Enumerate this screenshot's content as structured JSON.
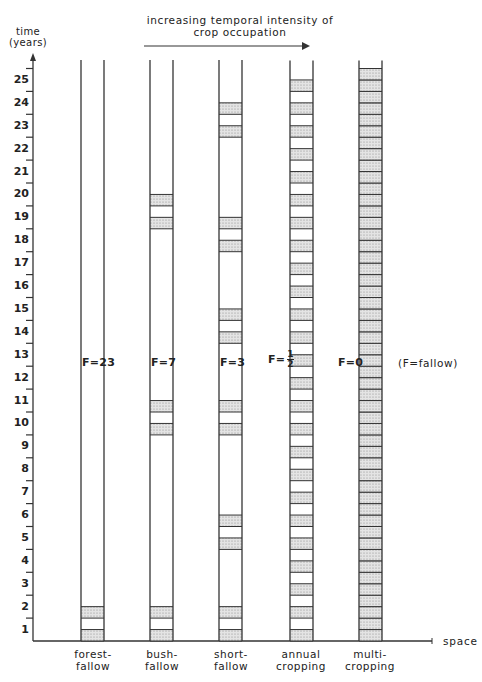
{
  "chart_data": {
    "type": "diagram",
    "title": "increasing temporal intensity of crop occupation",
    "title_lines": [
      "increasing temporal intensity of",
      "crop occupation"
    ],
    "ylabel": "time (years)",
    "ylabel_lines": [
      "time",
      "(years)"
    ],
    "xlabel": "space",
    "yticks": [
      1,
      2,
      3,
      4,
      5,
      6,
      7,
      8,
      9,
      10,
      11,
      12,
      13,
      14,
      15,
      16,
      17,
      18,
      19,
      20,
      21,
      22,
      23,
      24,
      25
    ],
    "ylim": [
      0,
      25
    ],
    "note": "(F = fallow)",
    "cropped_period_unit": "half-year cultivation band",
    "systems": [
      {
        "name": "forest-fallow",
        "label_lines": [
          "forest-",
          "fallow"
        ],
        "fallow_label": "F=23",
        "fallow_years": 23,
        "cultivated_years": [
          1,
          2
        ]
      },
      {
        "name": "bush-fallow",
        "label_lines": [
          "bush-",
          "fallow"
        ],
        "fallow_label": "F=7",
        "fallow_years": 7,
        "cultivated_years": [
          1,
          2,
          10,
          11,
          19,
          20
        ]
      },
      {
        "name": "short-fallow",
        "label_lines": [
          "short-",
          "fallow"
        ],
        "fallow_label": "F=3",
        "fallow_years": 3,
        "cultivated_years": [
          1,
          2,
          5,
          6,
          10,
          11,
          14,
          15,
          18,
          19,
          23,
          24
        ]
      },
      {
        "name": "annual cropping",
        "label_lines": [
          "annual",
          "cropping"
        ],
        "fallow_label": "F=1/2",
        "fallow_years": 0.5,
        "cultivated_years": "every year (one cropped half-year per year)"
      },
      {
        "name": "multi-cropping",
        "label_lines": [
          "multi-",
          "cropping"
        ],
        "fallow_label": "F=0",
        "fallow_years": 0,
        "cultivated_years": "continuous (all years)"
      }
    ]
  },
  "header": {
    "title_line1": "increasing temporal intensity of",
    "title_line2": "crop occupation"
  },
  "axis": {
    "y_label_line1": "time",
    "y_label_line2": "(years)",
    "x_label": "space",
    "ticks": [
      "25",
      "24",
      "23",
      "22",
      "21",
      "20",
      "19",
      "18",
      "17",
      "16",
      "15",
      "14",
      "13",
      "12",
      "11",
      "10",
      "9",
      "8",
      "7",
      "6",
      "5",
      "4",
      "3",
      "2",
      "1"
    ]
  },
  "columns": [
    {
      "label1": "forest-",
      "label2": "fallow",
      "f": "F=23"
    },
    {
      "label1": "bush-",
      "label2": "fallow",
      "f": "F=7"
    },
    {
      "label1": "short-",
      "label2": "fallow",
      "f": "F=3"
    },
    {
      "label1": "annual",
      "label2": "cropping",
      "f": "F=",
      "f_num": "1",
      "f_den": "2"
    },
    {
      "label1": "multi-",
      "label2": "cropping",
      "f": "F=0"
    }
  ],
  "legend": {
    "note": "(F=fallow)"
  },
  "colors": {
    "line": "#333333",
    "stipple": "#bdbdbd",
    "background": "#ffffff"
  }
}
